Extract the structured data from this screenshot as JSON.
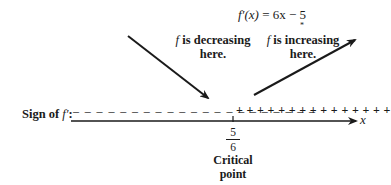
{
  "equation": {
    "lhs": "f′(x)",
    "eq": " = ",
    "rhs": "6x − 5",
    "marker": "*"
  },
  "annotations": {
    "decreasing": {
      "f": "f",
      "line1": " is decreasing",
      "line2": "here."
    },
    "increasing": {
      "f": "f",
      "line1": " is increasing",
      "line2": "here."
    }
  },
  "sign_chart": {
    "label": "Sign of f′:",
    "label_prefix": "Sign of ",
    "label_f": "f′",
    "label_suffix": ":",
    "negative_signs": "– – – – – – – – – – – – – – – – – – – – –",
    "positive_signs": "+ + + + + + + + + + + + + + +",
    "axis_variable": "x"
  },
  "critical_point": {
    "numerator": "5",
    "denominator": "6",
    "label_line1": "Critical",
    "label_line2": "point"
  },
  "colors": {
    "ink": "#1a1a1a",
    "background": "#ffffff"
  }
}
